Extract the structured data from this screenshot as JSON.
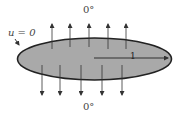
{
  "diagram": {
    "top_label": "0°",
    "bottom_label": "0°",
    "boundary_label": "u = 0",
    "radius_label": "1",
    "colors": {
      "fill": "#a9a9a9",
      "stroke": "#222222",
      "arrow": "#333333",
      "text": "#444444"
    },
    "up_arrows_x": [
      52,
      70,
      89,
      108,
      126
    ],
    "down_arrows_x": [
      42,
      60,
      81,
      102,
      122
    ]
  }
}
